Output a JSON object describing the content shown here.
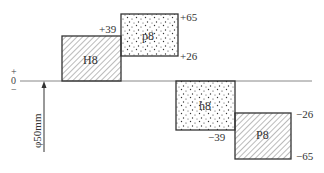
{
  "diagram": {
    "zero_line": {
      "label_plus": "+",
      "label_zero": "0",
      "label_minus": "−"
    },
    "basic_size": {
      "label": "φ50mm"
    },
    "zones": [
      {
        "name": "H8",
        "type": "hole",
        "fill": "hatch",
        "upper": "+39",
        "lower": "0"
      },
      {
        "name": "p8",
        "type": "shaft",
        "fill": "dots",
        "upper": "+65",
        "lower": "+26"
      },
      {
        "name": "h8",
        "type": "shaft",
        "fill": "dots",
        "upper": "0",
        "lower": "-39"
      },
      {
        "name": "P8",
        "type": "hole",
        "fill": "hatch",
        "upper": "-26",
        "lower": "-65"
      }
    ],
    "labels": {
      "h8_upper_h": "+39",
      "p8_upper": "+65",
      "p8_lower": "+26",
      "h8_lower": "−39",
      "P8_upper": "−26",
      "P8_lower": "−65"
    },
    "colors": {
      "line": "#333333",
      "zero_line": "#888888",
      "background": "#ffffff"
    }
  }
}
